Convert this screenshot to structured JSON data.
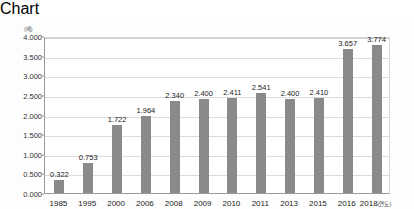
{
  "chart_data": {
    "type": "bar",
    "title": "",
    "subtitle": "",
    "xlabel": "(연도)",
    "ylabel": "(배)",
    "unit_label": "(배)",
    "xaxis_suffix": "(연도)",
    "categories": [
      "1985",
      "1995",
      "2000",
      "2006",
      "2008",
      "2009",
      "2010",
      "2011",
      "2013",
      "2015",
      "2016",
      "2018"
    ],
    "values": [
      0.322,
      0.753,
      1.722,
      1.964,
      2.34,
      2.4,
      2.411,
      2.541,
      2.4,
      2.41,
      3.657,
      3.774
    ],
    "value_labels": [
      "0.322",
      "0.753",
      "1.722",
      "1.964",
      "2.340",
      "2.400",
      "2.411",
      "2.541",
      "2.400",
      "2.410",
      "3.657",
      "3.774"
    ],
    "ylim": [
      0,
      4.0
    ],
    "ytick_step": 0.5,
    "ytick_labels": [
      "4.000",
      "3.500",
      "3.000",
      "2.500",
      "2.000",
      "1.500",
      "1.000",
      "0.500",
      "0.000"
    ],
    "ytick_values": [
      4.0,
      3.5,
      3.0,
      2.5,
      2.0,
      1.5,
      1.0,
      0.5,
      0.0
    ],
    "grid": true,
    "legend": false,
    "legend_position": "none",
    "bar_color": "#8a8a8a",
    "grid_color": "#dcdcdc",
    "axis_color": "#9a9a9a",
    "background_color": "#ffffff",
    "text_color": "#222222"
  }
}
